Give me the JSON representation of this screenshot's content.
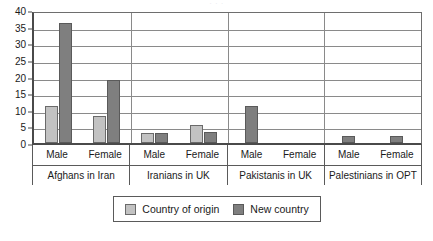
{
  "title_remnant": "· ·   ·",
  "chart_data": {
    "type": "bar",
    "title": "",
    "xlabel": "",
    "ylabel": "",
    "ylim": [
      0,
      40
    ],
    "yticks": [
      0,
      5,
      10,
      15,
      20,
      25,
      30,
      35,
      40
    ],
    "grid": true,
    "legend_position": "bottom",
    "categories": [
      "Afghans in Iran - Male",
      "Afghans in Iran - Female",
      "Iranians in UK - Male",
      "Iranians in UK - Female",
      "Pakistanis in UK - Male",
      "Pakistanis in UK - Female",
      "Palestinians in OPT - Male",
      "Palestinians in OPT - Female"
    ],
    "series": [
      {
        "name": "Country of origin",
        "color": "#c2c2c2",
        "values": [
          11,
          8,
          3,
          5.5,
          0,
          0,
          0,
          0
        ]
      },
      {
        "name": "New country",
        "color": "#7f7f7f",
        "values": [
          36,
          19,
          3,
          3.2,
          11,
          0,
          2,
          2
        ]
      }
    ],
    "groups": [
      {
        "name": "Afghans in Iran",
        "sexes": [
          {
            "label": "Male",
            "origin": 11,
            "new_country": 36
          },
          {
            "label": "Female",
            "origin": 8,
            "new_country": 19
          }
        ]
      },
      {
        "name": "Iranians in UK",
        "sexes": [
          {
            "label": "Male",
            "origin": 3,
            "new_country": 3
          },
          {
            "label": "Female",
            "origin": 5.5,
            "new_country": 3.2
          }
        ]
      },
      {
        "name": "Pakistanis in UK",
        "sexes": [
          {
            "label": "Male",
            "origin": 0,
            "new_country": 11
          },
          {
            "label": "Female",
            "origin": 0,
            "new_country": 0
          }
        ]
      },
      {
        "name": "Palestinians in OPT",
        "sexes": [
          {
            "label": "Male",
            "origin": 0,
            "new_country": 2
          },
          {
            "label": "Female",
            "origin": 0,
            "new_country": 2
          }
        ]
      }
    ]
  },
  "legend": {
    "items": [
      {
        "label": "Country of origin",
        "color": "#c2c2c2"
      },
      {
        "label": "New country",
        "color": "#7f7f7f"
      }
    ]
  }
}
